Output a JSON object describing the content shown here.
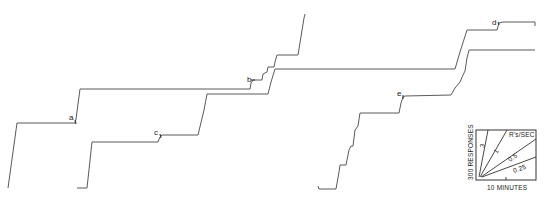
{
  "chart_data": {
    "type": "line",
    "title": "",
    "subtitle": "Cumulative records of responding",
    "xlabel": "",
    "ylabel": "",
    "grid": false,
    "series": [
      {
        "name": "record-1",
        "points": [
          [
            8,
            188
          ],
          [
            17,
            123
          ],
          [
            75,
            123
          ],
          [
            76,
            119
          ],
          [
            80,
            89
          ],
          [
            250,
            89
          ],
          [
            251,
            83
          ],
          [
            253,
            80
          ],
          [
            262,
            80
          ],
          [
            263,
            74
          ],
          [
            267,
            72
          ],
          [
            268,
            67
          ],
          [
            274,
            67
          ],
          [
            275,
            62
          ],
          [
            277,
            55
          ],
          [
            298,
            55
          ],
          [
            304,
            18
          ],
          [
            305,
            14
          ]
        ]
      },
      {
        "name": "record-2",
        "points": [
          [
            77,
            188
          ],
          [
            87,
            188
          ],
          [
            92,
            142
          ],
          [
            158,
            142
          ],
          [
            160,
            137
          ],
          [
            162,
            135
          ],
          [
            198,
            135
          ],
          [
            204,
            110
          ],
          [
            207,
            94
          ],
          [
            268,
            94
          ],
          [
            271,
            82
          ],
          [
            275,
            69
          ],
          [
            455,
            69
          ],
          [
            460,
            52
          ],
          [
            467,
            30
          ],
          [
            497,
            30
          ],
          [
            499,
            23
          ],
          [
            503,
            22
          ],
          [
            535,
            22
          ],
          [
            535,
            26
          ]
        ]
      },
      {
        "name": "record-3",
        "points": [
          [
            318,
            186
          ],
          [
            319,
            189
          ],
          [
            336,
            189
          ],
          [
            339,
            172
          ],
          [
            340,
            165
          ],
          [
            346,
            165
          ],
          [
            349,
            150
          ],
          [
            351,
            146
          ],
          [
            353,
            146
          ],
          [
            355,
            130
          ],
          [
            358,
            126
          ],
          [
            360,
            113
          ],
          [
            399,
            113
          ],
          [
            401,
            103
          ],
          [
            403,
            97
          ],
          [
            405,
            96
          ],
          [
            451,
            95
          ],
          [
            455,
            88
          ],
          [
            460,
            82
          ],
          [
            463,
            75
          ],
          [
            465,
            71
          ],
          [
            467,
            58
          ],
          [
            469,
            50
          ],
          [
            535,
            50
          ]
        ]
      }
    ],
    "annotations": [
      {
        "text": "a",
        "x": 69,
        "y": 120
      },
      {
        "text": "b",
        "x": 247,
        "y": 82
      },
      {
        "text": "c",
        "x": 154,
        "y": 135
      },
      {
        "text": "d",
        "x": 492,
        "y": 25
      },
      {
        "text": "e",
        "x": 397,
        "y": 96
      }
    ],
    "key": {
      "y_scale_label": "300 RESPONSES",
      "x_scale_label": "10 MINUTES",
      "rate_label": "R's/SEC",
      "rates": [
        "3",
        "1",
        "0.5",
        "0.25"
      ]
    }
  }
}
